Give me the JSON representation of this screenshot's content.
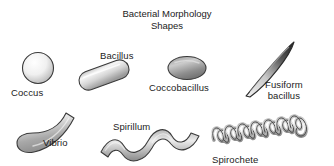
{
  "figure": {
    "title": "Bacterial Morphology\nShapes",
    "background_color": "#ffffff",
    "text_color": "#1b1b1b",
    "width": 334,
    "height": 166
  },
  "shapes": [
    {
      "id": "coccus",
      "label": "Coccus",
      "description": "sphere",
      "fill_light": "#fdfdfd",
      "fill_dark": "#b9b9b9",
      "stroke": "#3a3a3a"
    },
    {
      "id": "bacillus",
      "label": "Bacillus",
      "description": "rod / capsule",
      "fill_light": "#f2f2f2",
      "fill_dark": "#9b9b9b",
      "stroke": "#3a3a3a"
    },
    {
      "id": "coccobacillus",
      "label": "Coccobacillus",
      "description": "short oval rod",
      "fill_light": "#cfcfcf",
      "fill_dark": "#6e6e6e",
      "stroke": "#3a3a3a"
    },
    {
      "id": "fusiform-bacillus",
      "label": "Fusiform\nbacillus",
      "description": "tapered spindle",
      "fill_light": "#efefef",
      "fill_dark": "#2f2f2f",
      "stroke": "#2b2b2b"
    },
    {
      "id": "vibrio",
      "label": "Vibrio",
      "description": "curved comma rod",
      "fill_light": "#e0e0e0",
      "fill_dark": "#8e8e8e",
      "stroke": "#3a3a3a"
    },
    {
      "id": "spirillum",
      "label": "Spirillum",
      "description": "thick rigid wave",
      "fill_light": "#e3e3e3",
      "fill_dark": "#8a8a8a",
      "stroke": "#3a3a3a"
    },
    {
      "id": "spirochete",
      "label": "Spirochete",
      "description": "tight flexible helix",
      "fill_light": "#e6e6e6",
      "fill_dark": "#8f8f8f",
      "stroke": "#3a3a3a"
    }
  ]
}
